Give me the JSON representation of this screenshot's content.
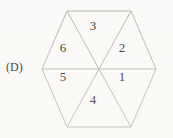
{
  "figure": {
    "label": "(D)",
    "shape": "hexagon",
    "sector_count": 6,
    "colors": {
      "background": "#fbfaf8",
      "stroke": "#b9b6b1",
      "text": "#333333",
      "label_text": "#2b2b2b"
    },
    "geometry": {
      "center_x": 99,
      "center_y": 69,
      "vertices": [
        {
          "name": "top-left",
          "x": 67,
          "y": 11
        },
        {
          "name": "top-right",
          "x": 131,
          "y": 11
        },
        {
          "name": "right",
          "x": 156,
          "y": 69
        },
        {
          "name": "bottom-right",
          "x": 131,
          "y": 127
        },
        {
          "name": "bottom-left",
          "x": 67,
          "y": 127
        },
        {
          "name": "left",
          "x": 42,
          "y": 69
        }
      ]
    },
    "sectors": [
      {
        "id": "sector-3",
        "label": "3",
        "position": "top",
        "x": 93,
        "y": 25
      },
      {
        "id": "sector-2",
        "label": "2",
        "position": "upper-right",
        "x": 122,
        "y": 47
      },
      {
        "id": "sector-1",
        "label": "1",
        "position": "lower-right",
        "x": 122,
        "y": 76
      },
      {
        "id": "sector-4",
        "label": "4",
        "position": "bottom",
        "x": 93,
        "y": 99
      },
      {
        "id": "sector-5",
        "label": "5",
        "position": "lower-left",
        "x": 63,
        "y": 76
      },
      {
        "id": "sector-6",
        "label": "6",
        "position": "upper-left",
        "x": 63,
        "y": 47
      }
    ]
  }
}
